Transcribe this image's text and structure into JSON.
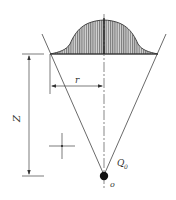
{
  "diagram": {
    "type": "cone-distribution-schematic",
    "labels": {
      "radius": "r",
      "height": "Z",
      "source_flux": "Q",
      "source_flux_sub": "0",
      "origin": "o"
    },
    "colors": {
      "line": "#333333",
      "hatch": "#555555",
      "fill": "#c8c8c8",
      "point": "#111111"
    }
  }
}
